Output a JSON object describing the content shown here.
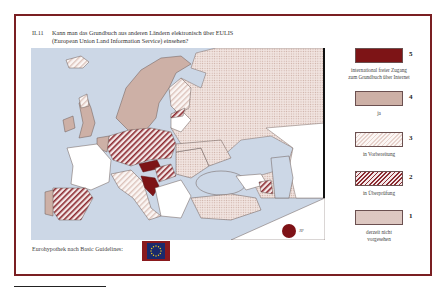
{
  "title": {
    "number": "II.11",
    "line1": "Kann man das Grundbuch aus anderen Ländern elektronisch über EULIS",
    "line2": "(European Union Land Information Service) einsehen?"
  },
  "legend": [
    {
      "value": "5",
      "label": "international freier Zugang zum Grundbuch über Internet",
      "label_line1": "international freier Zugang",
      "label_line2": "zum Grundbuch über Internet",
      "pattern": "solid-dark-red",
      "color": "#7d1416"
    },
    {
      "value": "4",
      "label": "ja",
      "label_line1": "ja",
      "label_line2": "",
      "pattern": "solid-beige",
      "color": "#cdb0a6"
    },
    {
      "value": "3",
      "label": "in Vorbereitung",
      "label_line1": "in Vorbereitung",
      "label_line2": "",
      "pattern": "light-diagonal-hatch",
      "color": "#e7d2cc"
    },
    {
      "value": "2",
      "label": "in Überprüfung",
      "label_line1": "in Überprüfung",
      "label_line2": "",
      "pattern": "dark-red-diagonal-hatch",
      "color": "#8c2a30"
    },
    {
      "value": "1",
      "label": "derzeit nicht vorgesehen",
      "label_line1": "derzeit nicht",
      "label_line2": "vorgesehen",
      "pattern": "dotted-beige",
      "color": "#f1e4e0"
    }
  ],
  "footer": {
    "label": "Eurohypothek nach Basic Guidelines:",
    "flag_icon": "eu-flag-icon"
  },
  "inset": {
    "jp_label": "JP",
    "jp_color": "#7e1216"
  },
  "colors": {
    "frame": "#7a1f22",
    "sea": "#ccd7e6",
    "no_data": "#ffffff"
  }
}
